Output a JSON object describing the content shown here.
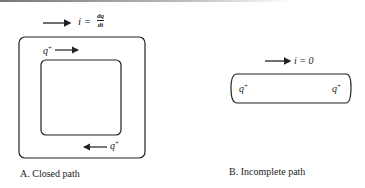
{
  "panel_a": {
    "current_label": "i = ",
    "frac_num": "dq",
    "frac_den": "dt",
    "charge_top": "q",
    "charge_bottom": "q",
    "plus": "+",
    "caption": "A.  Closed path"
  },
  "panel_b": {
    "current_label": "i = 0",
    "charge_left": "q",
    "charge_right": "q",
    "plus": "+",
    "caption": "B.  Incomplete path"
  }
}
